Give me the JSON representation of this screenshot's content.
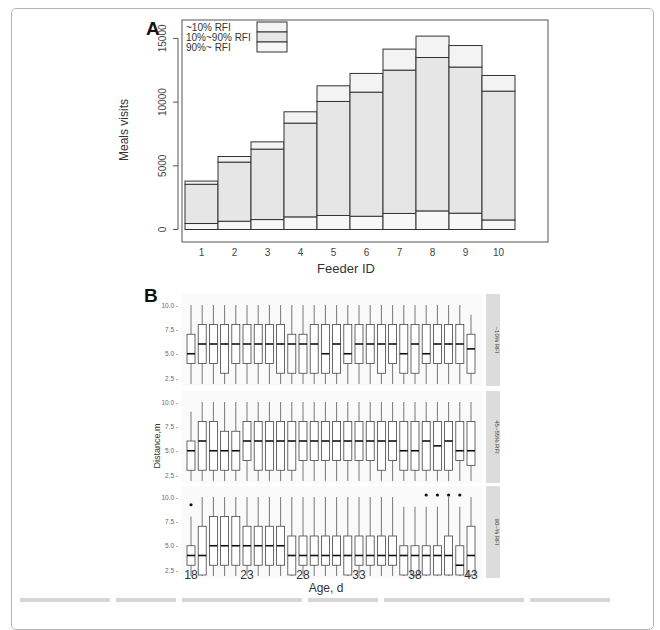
{
  "figure": {
    "panel_a_label": "A",
    "panel_b_label": "B"
  },
  "chart_data": [
    {
      "type": "bar",
      "stacked": true,
      "panel": "A",
      "title": "",
      "xlabel": "Feeder ID",
      "ylabel": "Meals visits",
      "ylim": [
        0,
        16500
      ],
      "yticks": [
        0,
        5000,
        10000,
        15000
      ],
      "yticklabels": [
        "0",
        "5000",
        "10000",
        "15000"
      ],
      "grid": false,
      "legend_position": "top-left",
      "categories": [
        "1",
        "2",
        "3",
        "4",
        "5",
        "6",
        "7",
        "8",
        "9",
        "10"
      ],
      "series": [
        {
          "name": "90%~ RFI",
          "values": [
            470,
            650,
            780,
            990,
            1100,
            1040,
            1260,
            1460,
            1280,
            750
          ],
          "color": "#f7f7f7"
        },
        {
          "name": "10%~90% RFI",
          "values": [
            3080,
            4640,
            5530,
            7360,
            8950,
            9740,
            11250,
            12040,
            11470,
            10110
          ],
          "color": "#e6e6e6"
        },
        {
          "name": "~10% RFI",
          "values": [
            250,
            440,
            570,
            890,
            1230,
            1470,
            1650,
            1680,
            1690,
            1230
          ],
          "color": "#f3f3f3"
        }
      ],
      "totals": [
        3800,
        5730,
        6880,
        9240,
        11280,
        12250,
        14160,
        15180,
        14440,
        12090
      ],
      "legend": [
        "~10% RFI",
        "10%~90% RFI",
        "90%~ RFI"
      ]
    },
    {
      "type": "boxplot",
      "panel": "B",
      "title": "",
      "xlabel": "Age, d",
      "ylabel": "Distance,m",
      "ylim": [
        0,
        10.5
      ],
      "yticks": [
        2.5,
        5.0,
        7.5,
        10.0
      ],
      "yticklabels": [
        "2.5 -",
        "5.0 -",
        "7.5 -",
        "10.0 -"
      ],
      "x": [
        18,
        19,
        20,
        21,
        22,
        23,
        24,
        25,
        26,
        27,
        28,
        29,
        30,
        31,
        32,
        33,
        34,
        35,
        36,
        37,
        38,
        39,
        40,
        41,
        42,
        43
      ],
      "xticks": [
        18,
        23,
        28,
        33,
        38,
        43
      ],
      "facets": [
        {
          "label": "~10% RFI",
          "whisker_low": [
            0,
            0,
            0,
            0,
            0,
            0,
            0,
            0,
            0,
            0,
            0,
            0,
            0,
            0,
            0,
            0,
            0,
            0,
            0,
            0,
            0,
            0,
            0,
            0,
            0,
            0
          ],
          "whisker_high": [
            10,
            10,
            10,
            10,
            10,
            10,
            10,
            10,
            10,
            10,
            10,
            10,
            10,
            10,
            10,
            10,
            10,
            10,
            10,
            10,
            10,
            10,
            10,
            10,
            10,
            9
          ],
          "q1": [
            4,
            4,
            4,
            3,
            4,
            4,
            4,
            4,
            3,
            3,
            3,
            3,
            3,
            3,
            4,
            4,
            4,
            3,
            4,
            3,
            3,
            4,
            4,
            4,
            4,
            3
          ],
          "median": [
            5,
            6,
            6,
            6,
            6,
            6,
            6,
            6,
            6,
            6,
            6,
            6,
            5,
            6,
            5,
            6,
            6,
            6,
            6,
            5,
            6,
            5,
            6,
            6,
            6,
            5.5
          ],
          "q3": [
            7,
            8,
            8,
            8,
            8,
            8,
            8,
            8,
            8,
            7,
            7,
            8,
            8,
            8,
            8,
            8,
            8,
            8,
            8,
            8,
            8,
            8,
            8,
            8,
            8,
            7
          ],
          "outliers": []
        },
        {
          "label": "45~55% RFI",
          "whisker_low": [
            0,
            0,
            0,
            0,
            0,
            0,
            0,
            0,
            0,
            0,
            0,
            0,
            0,
            0,
            0,
            0,
            0,
            0,
            0,
            0,
            0,
            0,
            0,
            0,
            0,
            0
          ],
          "whisker_high": [
            9,
            10,
            10,
            10,
            10,
            10,
            10,
            10,
            10,
            10,
            10,
            10,
            10,
            10,
            10,
            10,
            10,
            10,
            10,
            10,
            10,
            10,
            10,
            10,
            10,
            10
          ],
          "q1": [
            3,
            3,
            3,
            3,
            3,
            4,
            3,
            3,
            3,
            3,
            4,
            4,
            4,
            4,
            4,
            4,
            4,
            3,
            4,
            3,
            3,
            3,
            3,
            3,
            4,
            3.5
          ],
          "median": [
            5,
            6,
            5,
            5,
            5,
            6,
            6,
            6,
            6,
            6,
            6,
            6,
            6,
            6,
            6,
            6,
            6,
            6,
            6,
            5,
            5,
            6,
            5.5,
            6,
            5,
            5
          ],
          "q3": [
            6,
            8,
            8,
            7,
            7,
            8,
            8,
            8,
            8,
            8,
            8,
            8,
            8,
            8,
            8,
            8,
            8,
            8,
            8,
            8,
            8,
            8,
            8,
            8,
            8,
            8
          ],
          "outliers": []
        },
        {
          "label": "90~% RFI",
          "whisker_low": [
            0,
            0,
            0,
            0,
            0,
            0,
            0,
            0,
            0,
            0,
            0,
            0,
            0,
            0,
            0,
            0,
            0,
            0,
            0,
            0,
            0,
            0,
            0,
            0,
            0,
            0
          ],
          "whisker_high": [
            8,
            10,
            10,
            10,
            10,
            10,
            10,
            10,
            10,
            10,
            10,
            10,
            10,
            10,
            10,
            10,
            10,
            10,
            10,
            9,
            9,
            9,
            9,
            10,
            9,
            10
          ],
          "q1": [
            3,
            2,
            3,
            3,
            3,
            3,
            3,
            3,
            3,
            2,
            3,
            3,
            3,
            3,
            2,
            3,
            3,
            3,
            3,
            2,
            2,
            2,
            2,
            2,
            2,
            2
          ],
          "median": [
            4,
            4,
            5,
            5,
            5,
            5,
            5,
            5,
            5,
            4,
            4,
            4,
            4,
            4,
            4,
            4,
            4,
            4,
            4,
            4,
            4,
            4,
            4,
            4,
            3,
            4
          ],
          "q3": [
            5,
            7,
            8,
            8,
            8,
            7,
            7,
            7,
            7,
            6,
            6,
            6,
            6,
            6,
            6,
            6,
            6,
            6,
            6,
            5,
            5,
            5,
            5,
            6,
            5,
            7
          ],
          "outliers": [
            [
              18,
              9
            ],
            [
              39,
              10
            ],
            [
              40,
              10
            ],
            [
              41,
              10
            ],
            [
              42,
              10
            ]
          ]
        }
      ]
    }
  ]
}
